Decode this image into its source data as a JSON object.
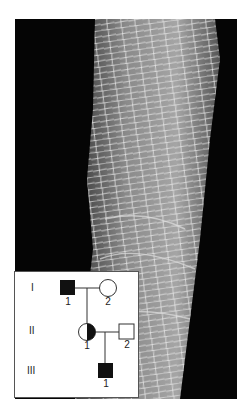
{
  "figure": {
    "photo": {
      "description": "clinical photograph of limb skin with reticulated scaling pattern",
      "background_color": "#050505",
      "skin_color": "#9a9a9a"
    },
    "pedigree": {
      "generations": [
        {
          "label": "I",
          "individuals": [
            {
              "label": "1",
              "sex": "male",
              "status": "affected"
            },
            {
              "label": "2",
              "sex": "female",
              "status": "unaffected"
            }
          ]
        },
        {
          "label": "II",
          "individuals": [
            {
              "label": "1",
              "sex": "female",
              "status": "carrier"
            },
            {
              "label": "2",
              "sex": "male",
              "status": "unaffected"
            }
          ]
        },
        {
          "label": "III",
          "individuals": [
            {
              "label": "1",
              "sex": "male",
              "status": "affected"
            }
          ]
        }
      ]
    }
  }
}
